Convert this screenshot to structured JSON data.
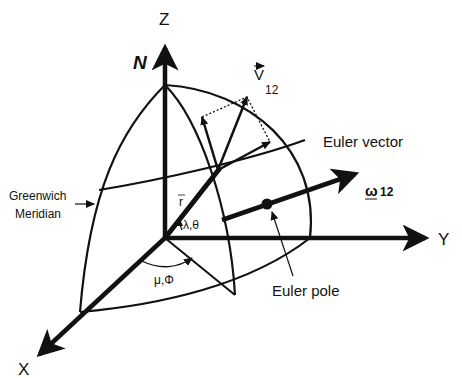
{
  "figure": {
    "colors": {
      "ink": "#111111",
      "background": "#ffffff"
    }
  },
  "axes": {
    "z_label": "Z",
    "y_label": "Y",
    "x_label": "X"
  },
  "labels": {
    "north_pole": "N",
    "velocity_symbol": "V",
    "velocity_subscript": "12",
    "euler_vector": "Euler vector",
    "omega_symbol": "ω",
    "omega_subscript": "12",
    "greenwich_line1": "Greenwich",
    "greenwich_line2": "Meridian",
    "position_vector": "r",
    "lat_lon_point": "λ,θ",
    "lat_lon_pole": "μ,Φ",
    "euler_pole": "Euler pole"
  }
}
